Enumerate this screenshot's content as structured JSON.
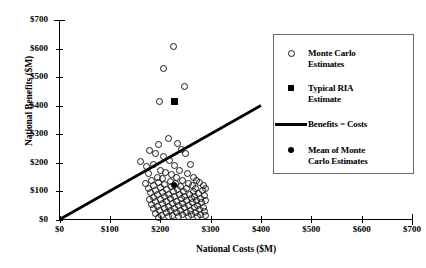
{
  "chart_data": {
    "type": "scatter",
    "title": "",
    "xlabel": "National Costs ($M)",
    "ylabel": "National Benefits ($M)",
    "xlim": [
      0,
      700
    ],
    "ylim": [
      0,
      700
    ],
    "xticks": [
      "$0",
      "$100",
      "$200",
      "$300",
      "$400",
      "$500",
      "$600",
      "$700"
    ],
    "yticks": [
      "$0",
      "$100",
      "$200",
      "$300",
      "$400",
      "$500",
      "$600",
      "$700"
    ],
    "xtick_values": [
      0,
      100,
      200,
      300,
      400,
      500,
      600,
      700
    ],
    "ytick_values": [
      0,
      100,
      200,
      300,
      400,
      500,
      600,
      700
    ],
    "grid": false,
    "legend_position": "upper-right",
    "series": [
      {
        "name": "Monte Carlo Estimates",
        "marker": "open-circle",
        "points": [
          [
            225,
            610
          ],
          [
            205,
            530
          ],
          [
            248,
            470
          ],
          [
            197,
            415
          ],
          [
            196,
            265
          ],
          [
            215,
            285
          ],
          [
            178,
            245
          ],
          [
            233,
            268
          ],
          [
            160,
            205
          ],
          [
            190,
            232
          ],
          [
            241,
            248
          ],
          [
            206,
            222
          ],
          [
            172,
            188
          ],
          [
            218,
            210
          ],
          [
            250,
            232
          ],
          [
            186,
            196
          ],
          [
            228,
            190
          ],
          [
            199,
            175
          ],
          [
            260,
            196
          ],
          [
            176,
            162
          ],
          [
            209,
            168
          ],
          [
            238,
            172
          ],
          [
            193,
            150
          ],
          [
            222,
            158
          ],
          [
            253,
            162
          ],
          [
            181,
            140
          ],
          [
            204,
            145
          ],
          [
            231,
            148
          ],
          [
            266,
            150
          ],
          [
            170,
            128
          ],
          [
            196,
            133
          ],
          [
            219,
            136
          ],
          [
            244,
            138
          ],
          [
            272,
            140
          ],
          [
            185,
            122
          ],
          [
            208,
            125
          ],
          [
            229,
            127
          ],
          [
            256,
            129
          ],
          [
            278,
            131
          ],
          [
            175,
            112
          ],
          [
            200,
            115
          ],
          [
            222,
            117
          ],
          [
            240,
            118
          ],
          [
            263,
            120
          ],
          [
            284,
            121
          ],
          [
            190,
            104
          ],
          [
            212,
            106
          ],
          [
            234,
            108
          ],
          [
            252,
            109
          ],
          [
            270,
            110
          ],
          [
            288,
            112
          ],
          [
            180,
            96
          ],
          [
            203,
            98
          ],
          [
            225,
            99
          ],
          [
            246,
            100
          ],
          [
            265,
            101
          ],
          [
            282,
            103
          ],
          [
            194,
            88
          ],
          [
            216,
            89
          ],
          [
            237,
            90
          ],
          [
            257,
            91
          ],
          [
            275,
            92
          ],
          [
            186,
            80
          ],
          [
            207,
            81
          ],
          [
            228,
            82
          ],
          [
            248,
            83
          ],
          [
            268,
            84
          ],
          [
            286,
            85
          ],
          [
            178,
            72
          ],
          [
            199,
            73
          ],
          [
            220,
            74
          ],
          [
            241,
            75
          ],
          [
            261,
            76
          ],
          [
            279,
            77
          ],
          [
            190,
            64
          ],
          [
            211,
            65
          ],
          [
            232,
            66
          ],
          [
            252,
            67
          ],
          [
            271,
            68
          ],
          [
            288,
            69
          ],
          [
            182,
            56
          ],
          [
            203,
            57
          ],
          [
            224,
            58
          ],
          [
            244,
            59
          ],
          [
            264,
            60
          ],
          [
            281,
            61
          ],
          [
            194,
            48
          ],
          [
            215,
            49
          ],
          [
            236,
            50
          ],
          [
            256,
            51
          ],
          [
            274,
            52
          ],
          [
            186,
            40
          ],
          [
            207,
            41
          ],
          [
            228,
            42
          ],
          [
            248,
            43
          ],
          [
            267,
            44
          ],
          [
            284,
            45
          ],
          [
            198,
            32
          ],
          [
            219,
            33
          ],
          [
            240,
            34
          ],
          [
            259,
            35
          ],
          [
            277,
            36
          ],
          [
            190,
            24
          ],
          [
            211,
            25
          ],
          [
            232,
            26
          ],
          [
            251,
            27
          ],
          [
            269,
            28
          ],
          [
            286,
            29
          ],
          [
            202,
            16
          ],
          [
            223,
            17
          ],
          [
            243,
            18
          ],
          [
            262,
            19
          ],
          [
            279,
            20
          ],
          [
            195,
            10
          ],
          [
            216,
            11
          ],
          [
            236,
            12
          ],
          [
            255,
            13
          ],
          [
            273,
            14
          ],
          [
            289,
            15
          ]
        ]
      },
      {
        "name": "Typical RIA Estimate",
        "marker": "filled-square",
        "points": [
          [
            228,
            415
          ]
        ]
      },
      {
        "name": "Mean of Monte Carlo Estimates",
        "marker": "filled-dot",
        "points": [
          [
            228,
            122
          ]
        ]
      },
      {
        "name": "Benefits = Costs",
        "marker": "line",
        "line": [
          [
            0,
            0
          ],
          [
            400,
            400
          ]
        ]
      }
    ]
  },
  "legend": {
    "items": [
      {
        "key": "open-circle",
        "label": "Monte Carlo\nEstimates"
      },
      {
        "key": "filled-square",
        "label": "Typical RIA\nEstimate"
      },
      {
        "key": "line",
        "label": "Benefits = Costs"
      },
      {
        "key": "filled-dot",
        "label": "Mean of Monte\nCarlo Estimates"
      }
    ],
    "labels": {
      "monte_carlo_l1": "Monte Carlo",
      "monte_carlo_l2": "Estimates",
      "ria_l1": "Typical RIA",
      "ria_l2": "Estimate",
      "benefits_costs": "Benefits = Costs",
      "mean_l1": "Mean of Monte",
      "mean_l2": "Carlo Estimates"
    }
  },
  "colors": {
    "marker_stroke": "#1a1a1a",
    "axis": "#000000",
    "legend_border": "#6b6b6b",
    "background": "#ffffff"
  }
}
